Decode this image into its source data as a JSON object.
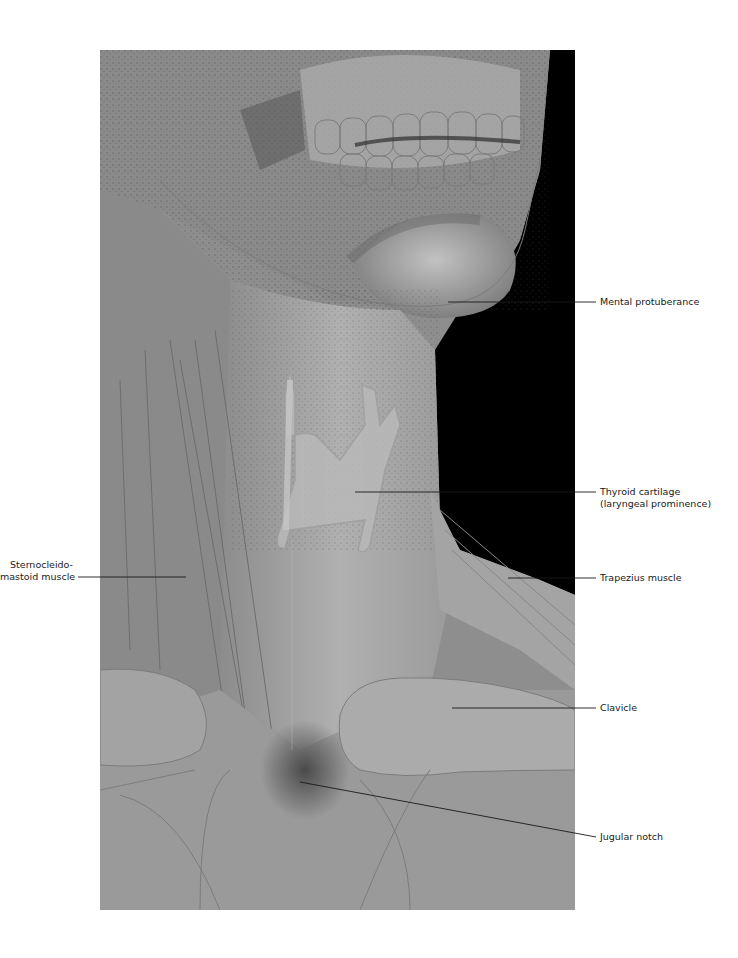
{
  "figure": {
    "colors": {
      "skin_light": "#b4b4b4",
      "skin_mid": "#9a9a9a",
      "skin_dark": "#6e6e6e",
      "background_black": "#000000",
      "outline": "#7c7c7c",
      "leader_line": "#1a1a1a"
    }
  },
  "labels": [
    {
      "id": "mental-protuberance",
      "text": "Mental protuberance"
    },
    {
      "id": "thyroid-cartilage",
      "line1": "Thyroid cartilage",
      "line2": "(laryngeal prominence)"
    },
    {
      "id": "sternocleidomastoid",
      "line1": "Sternocleido-",
      "line2": "mastoid muscle"
    },
    {
      "id": "trapezius",
      "text": "Trapezius muscle"
    },
    {
      "id": "clavicle",
      "text": "Clavicle"
    },
    {
      "id": "jugular-notch",
      "text": "Jugular notch"
    }
  ]
}
